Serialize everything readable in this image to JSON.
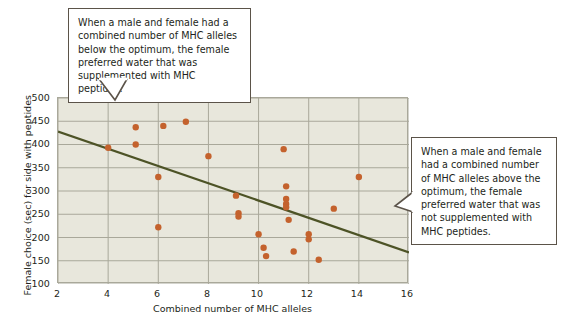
{
  "figure": {
    "background_color": "#ffffff",
    "plot_background_color": "#e8e7dc",
    "grid_color": "#a9a89a",
    "point_color": "#c4622d",
    "trend_line_color": "#4d5326",
    "callout_border_color": "#5b5349"
  },
  "callouts": {
    "top": {
      "text": "When a male and female had a combined number of MHC alleles below the optimum, the female preferred water that was supplemented with MHC peptides.",
      "pointer": "down"
    },
    "right": {
      "text": "When a male and female had a combined number of MHC alleles above the optimum, the female preferred water that was not supplemented with MHC peptides.",
      "pointer": "left"
    }
  },
  "chart_data": {
    "type": "scatter",
    "title": "",
    "xlabel": "Combined number of MHC alleles",
    "ylabel": "Female choice (sec) for side with peptides",
    "xlim": [
      2,
      16
    ],
    "ylim": [
      100,
      500
    ],
    "xticks": [
      2,
      4,
      6,
      8,
      10,
      12,
      14,
      16
    ],
    "yticks": [
      100,
      150,
      200,
      250,
      300,
      350,
      400,
      450,
      500
    ],
    "grid": true,
    "legend": "none",
    "series": [
      {
        "name": "Female choice",
        "marker": "circle",
        "color": "#c4622d",
        "points": [
          [
            4.0,
            393
          ],
          [
            5.1,
            437
          ],
          [
            5.1,
            400
          ],
          [
            6.0,
            330
          ],
          [
            6.0,
            222
          ],
          [
            6.2,
            440
          ],
          [
            7.1,
            449
          ],
          [
            8.0,
            375
          ],
          [
            9.1,
            290
          ],
          [
            9.2,
            252
          ],
          [
            9.2,
            245
          ],
          [
            10.0,
            207
          ],
          [
            10.2,
            178
          ],
          [
            10.3,
            160
          ],
          [
            11.0,
            390
          ],
          [
            11.1,
            310
          ],
          [
            11.1,
            283
          ],
          [
            11.1,
            272
          ],
          [
            11.1,
            265
          ],
          [
            11.2,
            238
          ],
          [
            11.4,
            170
          ],
          [
            12.0,
            207
          ],
          [
            12.0,
            196
          ],
          [
            12.4,
            152
          ],
          [
            13.0,
            262
          ],
          [
            14.0,
            330
          ]
        ]
      }
    ],
    "trend_line": {
      "name": "Linear regression",
      "color": "#4d5326",
      "x_start": 2,
      "y_start": 428,
      "x_end": 16,
      "y_end": 168
    }
  },
  "axis_labels": {
    "y": [
      "500",
      "450",
      "400",
      "350",
      "300",
      "250",
      "200",
      "150",
      "100"
    ],
    "x": [
      "2",
      "4",
      "6",
      "8",
      "10",
      "12",
      "14",
      "16"
    ]
  }
}
